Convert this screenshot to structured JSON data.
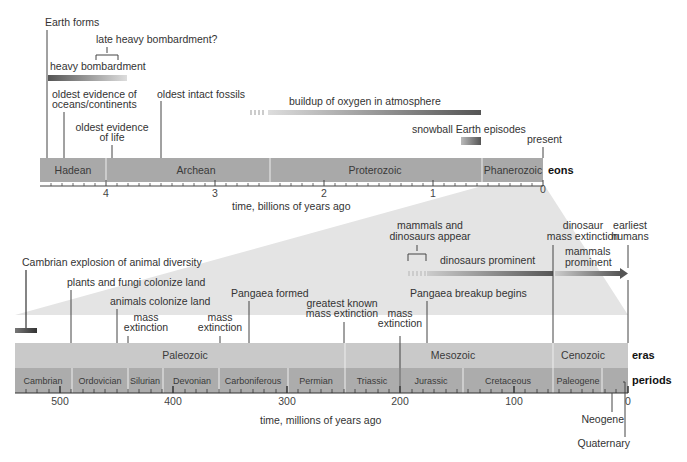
{
  "top_scale": {
    "axis_label": "time, billions of years ago",
    "ticks": [
      "4",
      "3",
      "2",
      "1",
      "0"
    ],
    "row_label": "eons",
    "eons": [
      "Hadean",
      "Archean",
      "Proterozoic",
      "Phanerozoic"
    ],
    "present_label": "present",
    "events": {
      "earth_forms": "Earth forms",
      "late_heavy_bombardment": "late heavy bombardment?",
      "heavy_bombardment": "heavy bombardment",
      "oldest_oceans_line1": "oldest evidence of",
      "oldest_oceans_line2": "oceans/continents",
      "oldest_life_line1": "oldest evidence",
      "oldest_life_line2": "of life",
      "oldest_fossils": "oldest intact fossils",
      "oxygen": "buildup of oxygen in atmosphere",
      "snowball": "snowball Earth episodes"
    }
  },
  "bottom_scale": {
    "axis_label": "time, millions of years ago",
    "ticks": [
      "500",
      "400",
      "300",
      "200",
      "100",
      "0"
    ],
    "eras_label": "eras",
    "periods_label": "periods",
    "eras": [
      "Paleozoic",
      "Mesozoic",
      "Cenozoic"
    ],
    "periods": [
      "Cambrian",
      "Ordovician",
      "Silurian",
      "Devonian",
      "Carboniferous",
      "Permian",
      "Triassic",
      "Jurassic",
      "Cretaceous",
      "Paleogene"
    ],
    "neogene": "Neogene",
    "quaternary": "Quaternary",
    "events": {
      "cambrian_explosion": "Cambrian explosion of animal diversity",
      "plants_fungi": "plants and fungi colonize land",
      "animals_land": "animals colonize land",
      "mass_ext_1a": "mass",
      "mass_ext_1b": "extinction",
      "mass_ext_2a": "mass",
      "mass_ext_2b": "extinction",
      "pangaea_formed": "Pangaea formed",
      "greatest_ext_1": "greatest known",
      "greatest_ext_2": "mass extinction",
      "mass_ext_3a": "mass",
      "mass_ext_3b": "extinction",
      "pangaea_breakup": "Pangaea breakup begins",
      "mammals_dinos_1": "mammals and",
      "mammals_dinos_2": "dinosaurs appear",
      "dinos_prominent": "dinosaurs prominent",
      "dino_ext_1": "dinosaur",
      "dino_ext_2": "mass extinction",
      "mammals_prom_1": "mammals",
      "mammals_prom_2": "prominent",
      "earliest_humans_1": "earliest",
      "earliest_humans_2": "humans"
    }
  }
}
